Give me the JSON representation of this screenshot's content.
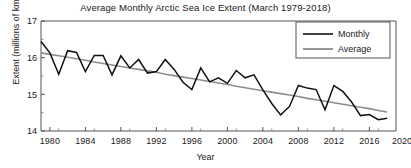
{
  "chart_data": {
    "type": "line",
    "title": "Average Monthly Arctic Sea Ice Extent (March 1979-2018)",
    "xlabel": "Year",
    "ylabel": "Extent (millions of km²)",
    "xlim": [
      1979,
      2019
    ],
    "ylim": [
      14,
      17
    ],
    "grid": false,
    "legend_position": "top-right",
    "x_ticks": [
      "1980",
      "1984",
      "1988",
      "1992",
      "1996",
      "2000",
      "2004",
      "2008",
      "2012",
      "2016",
      "2020"
    ],
    "x_tick_values": [
      1980,
      1984,
      1988,
      1992,
      1996,
      2000,
      2004,
      2008,
      2012,
      2016,
      2020
    ],
    "y_ticks": [
      "14",
      "15",
      "16",
      "17"
    ],
    "y_tick_values": [
      14,
      15,
      16,
      17
    ],
    "y_minor_tick_values": [
      14.5,
      15.5,
      16.5
    ],
    "x": [
      1979,
      1980,
      1981,
      1982,
      1983,
      1984,
      1985,
      1986,
      1987,
      1988,
      1989,
      1990,
      1991,
      1992,
      1993,
      1994,
      1995,
      1996,
      1997,
      1998,
      1999,
      2000,
      2001,
      2002,
      2003,
      2004,
      2005,
      2006,
      2007,
      2008,
      2009,
      2010,
      2011,
      2012,
      2013,
      2014,
      2015,
      2016,
      2017,
      2018
    ],
    "series": [
      {
        "name": "Monthly",
        "color": "#111111",
        "values": [
          16.44,
          16.13,
          15.55,
          16.19,
          16.14,
          15.62,
          16.06,
          16.06,
          15.53,
          16.05,
          15.72,
          15.95,
          15.58,
          15.62,
          15.95,
          15.68,
          15.33,
          15.13,
          15.72,
          15.34,
          15.45,
          15.3,
          15.65,
          15.45,
          15.53,
          15.12,
          14.75,
          14.44,
          14.67,
          15.24,
          15.17,
          15.13,
          14.58,
          15.24,
          15.08,
          14.79,
          14.42,
          14.45,
          14.31,
          14.35
        ]
      },
      {
        "name": "Average",
        "color": "#8d8d8d",
        "values": [
          16.13,
          16.09,
          16.05,
          16.01,
          15.97,
          15.93,
          15.88,
          15.84,
          15.8,
          15.76,
          15.72,
          15.68,
          15.64,
          15.6,
          15.55,
          15.51,
          15.47,
          15.43,
          15.39,
          15.35,
          15.31,
          15.27,
          15.22,
          15.18,
          15.14,
          15.1,
          15.06,
          15.02,
          14.98,
          14.94,
          14.89,
          14.85,
          14.81,
          14.77,
          14.73,
          14.69,
          14.65,
          14.61,
          14.56,
          14.52
        ]
      }
    ]
  },
  "legend": {
    "entries": [
      {
        "label": "Monthly"
      },
      {
        "label": "Average"
      }
    ]
  }
}
